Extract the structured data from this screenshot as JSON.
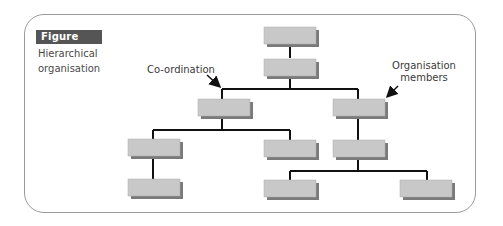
{
  "figure": {
    "badge": "Figure 11.3",
    "caption_line1": "Hierarchical",
    "caption_line2": "organisation"
  },
  "annotations": {
    "coordination": "Co-ordination",
    "members_line1": "Organisation",
    "members_line2": "members"
  },
  "colors": {
    "frame_border": "#9a9a9a",
    "badge_bg": "#555555",
    "box_fill": "#c8c8c8",
    "box_shadow": "#7a7a7a",
    "connector": "#111111"
  },
  "org_chart": {
    "levels": 5,
    "nodes": [
      {
        "id": "root",
        "level": 0
      },
      {
        "id": "coord",
        "level": 1,
        "parent": "root"
      },
      {
        "id": "left",
        "level": 2,
        "parent": "coord"
      },
      {
        "id": "right",
        "level": 2,
        "parent": "coord"
      },
      {
        "id": "left-a",
        "level": 3,
        "parent": "left"
      },
      {
        "id": "left-b",
        "level": 3,
        "parent": "left"
      },
      {
        "id": "right-a",
        "level": 3,
        "parent": "right"
      },
      {
        "id": "left-a-1",
        "level": 4,
        "parent": "left-a"
      },
      {
        "id": "right-a-1",
        "level": 4,
        "parent": "right-a"
      },
      {
        "id": "right-a-2",
        "level": 4,
        "parent": "right-a"
      }
    ]
  }
}
